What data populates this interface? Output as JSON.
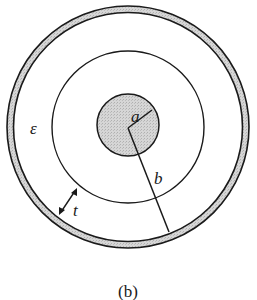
{
  "figure": {
    "caption": "(b)",
    "labels": {
      "inner_radius": "a",
      "outer_radius": "b",
      "permittivity": "ε",
      "thickness": "t"
    },
    "colors": {
      "stroke": "#1a1a1a",
      "fill_conductor": "#cfcfcf",
      "background": "#ffffff"
    },
    "geometry": {
      "center": [
        128,
        127
      ],
      "outer_shield_outer_r": 121,
      "outer_shield_inner_r": 114,
      "middle_circle_r": 76,
      "inner_conductor_r": 31
    }
  }
}
